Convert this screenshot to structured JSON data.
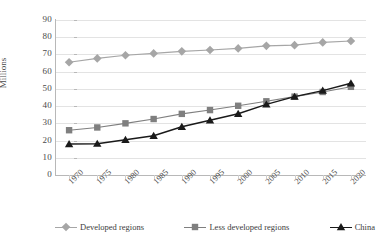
{
  "chart_data": {
    "type": "line",
    "title": "",
    "xlabel": "",
    "ylabel": "Millions",
    "ylim": [
      0,
      90
    ],
    "ytick_step": 10,
    "grid": true,
    "legend_position": "bottom",
    "categories": [
      "1970",
      "1975",
      "1980",
      "1985",
      "1990",
      "1995",
      "2000",
      "2005",
      "2010",
      "2015",
      "2020"
    ],
    "series": [
      {
        "name": "Developed regions",
        "marker": "diamond",
        "color": "#a6a6a6",
        "values": [
          65.5,
          67.7,
          69.5,
          70.6,
          71.8,
          72.6,
          73.5,
          75.0,
          75.4,
          77.0,
          77.8
        ]
      },
      {
        "name": "Less developed regions",
        "marker": "square",
        "color": "#7f7f7f",
        "values": [
          26.0,
          27.6,
          30.0,
          32.5,
          35.5,
          37.7,
          40.2,
          42.8,
          45.5,
          48.2,
          51.2
        ]
      },
      {
        "name": "China",
        "marker": "triangle",
        "color": "#1a1a1a",
        "values": [
          18.0,
          18.2,
          20.5,
          22.8,
          28.0,
          31.8,
          35.6,
          41.0,
          45.5,
          49.0,
          53.3
        ]
      }
    ],
    "ytick_labels": [
      "0",
      "10",
      "20",
      "30",
      "40",
      "50",
      "60",
      "70",
      "80",
      "90"
    ],
    "xtick_labels": [
      "1970",
      "1975",
      "1980",
      "1985",
      "1990",
      "1995",
      "2000",
      "2005",
      "2010",
      "2015",
      "2020"
    ]
  },
  "axis": {
    "y_title": "Millions"
  },
  "legend": {
    "items": [
      {
        "label": "Developed regions",
        "icon": "diamond-marker-icon"
      },
      {
        "label": "Less developed regions",
        "icon": "square-marker-icon"
      },
      {
        "label": "China",
        "icon": "triangle-marker-icon"
      }
    ]
  }
}
